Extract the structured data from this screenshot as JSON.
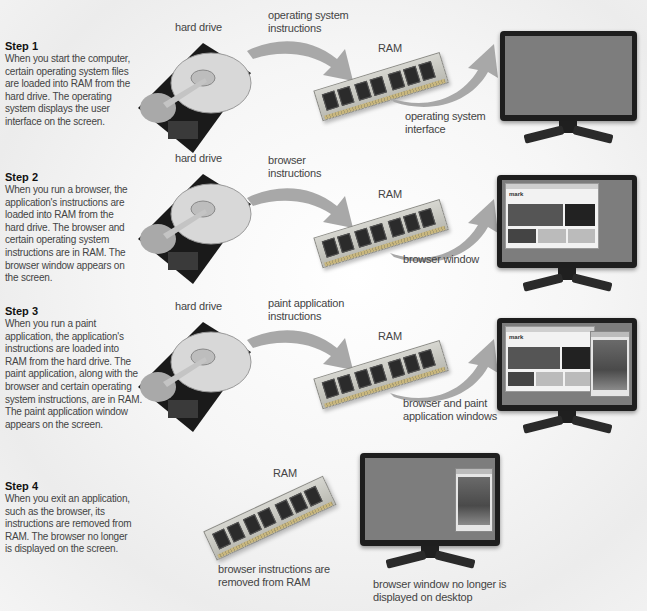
{
  "steps": [
    {
      "title": "Step 1",
      "text": "When you start the computer, certain operating system files are loaded into RAM from the hard drive. The operating system displays the user interface on the screen.",
      "hard_drive_label": "hard drive",
      "arrow_in_label": "operating system instructions",
      "ram_label": "RAM",
      "arrow_out_label": "operating system interface",
      "screen_state": "desktop"
    },
    {
      "title": "Step 2",
      "text": "When you run a browser, the application's instructions are loaded into RAM from the hard drive. The browser and certain operating system instructions are in RAM. The browser window appears on the screen.",
      "hard_drive_label": "hard drive",
      "arrow_in_label": "browser instructions",
      "ram_label": "RAM",
      "arrow_out_label": "browser window",
      "screen_state": "browser"
    },
    {
      "title": "Step 3",
      "text": "When you run a paint application, the application's instructions are loaded into RAM from the hard drive. The paint application, along with the browser and certain operating system instructions, are in RAM. The paint application window appears on the screen.",
      "hard_drive_label": "hard drive",
      "arrow_in_label": "paint application instructions",
      "ram_label": "RAM",
      "arrow_out_label": "browser and paint application windows",
      "screen_state": "browser-and-paint"
    },
    {
      "title": "Step 4",
      "text": "When you exit an application, such as the browser, its instructions are removed from RAM. The browser no longer is displayed on the screen.",
      "ram_label": "RAM",
      "ram_caption": "browser instructions are removed from RAM",
      "monitor_caption": "browser window no longer is displayed on desktop",
      "screen_state": "paint-only"
    }
  ],
  "browser_brand": "mark",
  "colors": {
    "arrow": "#a8a8a8",
    "screen": "#7d7d7d",
    "monitor_bezel": "#1e1e1e",
    "background": "#f4f4f4"
  }
}
